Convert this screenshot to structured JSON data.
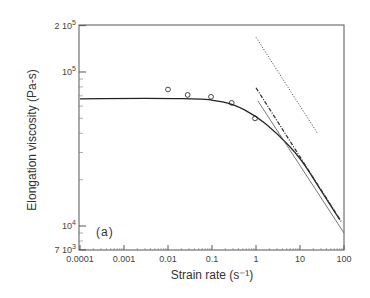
{
  "chart_data": {
    "type": "line",
    "title": "",
    "panel_label": "(a)",
    "xlabel": "Strain rate (s⁻¹)",
    "ylabel": "Elongation viscosity (Pa-s)",
    "xscale": "log",
    "yscale": "log",
    "xlim": [
      0.0001,
      100
    ],
    "ylim": [
      7000,
      200000
    ],
    "x_ticks": [
      {
        "value": 0.0001,
        "label": "0.0001"
      },
      {
        "value": 0.001,
        "label": "0.001"
      },
      {
        "value": 0.01,
        "label": "0.01"
      },
      {
        "value": 0.1,
        "label": "0.1"
      },
      {
        "value": 1,
        "label": "1"
      },
      {
        "value": 10,
        "label": "10"
      },
      {
        "value": 100,
        "label": "100"
      }
    ],
    "y_ticks": [
      {
        "value": 7000,
        "label_base": "7 10",
        "label_exp": "3"
      },
      {
        "value": 10000,
        "label_base": "10",
        "label_exp": "4"
      },
      {
        "value": 100000,
        "label_base": "10",
        "label_exp": "5"
      },
      {
        "value": 200000,
        "label_base": "2 10",
        "label_exp": "5"
      }
    ],
    "grid": false,
    "legend": null,
    "series": [
      {
        "name": "measured",
        "style": "markers-open-circle",
        "x": [
          0.01,
          0.028,
          0.095,
          0.28,
          0.95
        ],
        "y": [
          77000,
          71000,
          69000,
          63000,
          50000
        ]
      },
      {
        "name": "model curve",
        "style": "solid",
        "x": [
          0.0001,
          0.001,
          0.01,
          0.05,
          0.1,
          0.3,
          1,
          3,
          10,
          30,
          80
        ],
        "y": [
          67000,
          67500,
          67500,
          67000,
          66000,
          62000,
          52000,
          40000,
          28000,
          17000,
          11000
        ]
      },
      {
        "name": "dotted slope line",
        "style": "dotted",
        "x": [
          1,
          25
        ],
        "y": [
          168000,
          40000
        ]
      },
      {
        "name": "dash-dot line",
        "style": "dashdot",
        "x": [
          1,
          90
        ],
        "y": [
          79000,
          10500
        ]
      },
      {
        "name": "thin solid line",
        "style": "solid-thin",
        "x": [
          1.1,
          100
        ],
        "y": [
          65000,
          9000
        ]
      }
    ]
  }
}
